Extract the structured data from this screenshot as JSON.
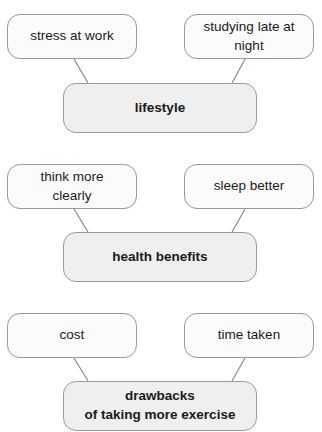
{
  "diagram": {
    "groups": [
      {
        "center": "lifestyle",
        "left": "stress at work",
        "right": "studying late at\nnight"
      },
      {
        "center": "health benefits",
        "left": "think more\nclearly",
        "right": "sleep better"
      },
      {
        "center": "drawbacks\nof taking more exercise",
        "left": "cost",
        "right": "time taken"
      }
    ]
  },
  "colors": {
    "border": "#9a9a9a",
    "connector": "#8a8a8a",
    "outer_fill": "#fbfbfb",
    "center_fill": "#efefef",
    "text": "#1a1a1a"
  }
}
